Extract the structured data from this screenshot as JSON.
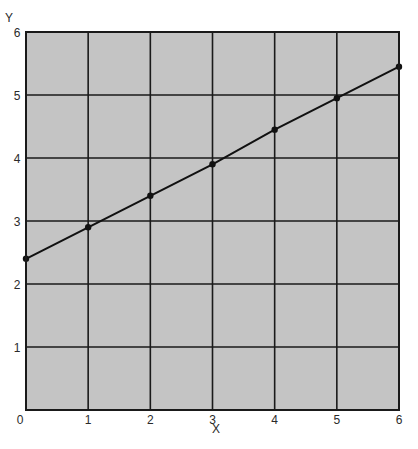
{
  "chart_data": {
    "type": "line",
    "title": "",
    "xlabel": "X",
    "ylabel": "Y",
    "xlim": [
      0,
      6
    ],
    "ylim": [
      0,
      6
    ],
    "x_ticks": [
      "0",
      "1",
      "2",
      "3",
      "4",
      "5",
      "6"
    ],
    "y_ticks": [
      "1",
      "2",
      "3",
      "4",
      "5",
      "6"
    ],
    "grid": true,
    "legend": null,
    "series": [
      {
        "name": "line",
        "x": [
          0,
          1,
          2,
          3,
          4,
          5,
          6
        ],
        "y": [
          2.4,
          2.9,
          3.4,
          3.9,
          4.45,
          4.95,
          5.45
        ],
        "marker": "circle",
        "color": "#111111"
      }
    ],
    "colors": {
      "plot_background": "#c4c4c4",
      "grid": "#1a1a1a",
      "line": "#111111"
    }
  }
}
